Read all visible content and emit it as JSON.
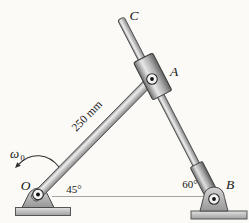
{
  "diagram": {
    "labels": {
      "point_o": "O",
      "point_a": "A",
      "point_b": "B",
      "point_c": "C",
      "angle_at_o": "45°",
      "angle_at_b": "60°",
      "bar_length": "250 mm",
      "omega_symbol": "ω",
      "omega_subscript": "0"
    },
    "geometry": {
      "bar_oa_angle_deg": 45,
      "rod_bc_angle_deg": 60,
      "bar_oa_length_label": "250 mm"
    },
    "colors": {
      "background": "#fbfaf7",
      "metal_light": "#eeeeee",
      "metal_mid": "#cccccc",
      "metal_dark": "#868686",
      "outline": "#4d4d4d",
      "ground": "#9f9f9f",
      "label_text": "#161616"
    }
  }
}
